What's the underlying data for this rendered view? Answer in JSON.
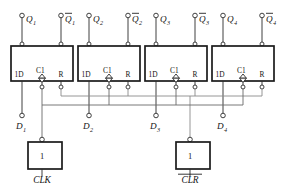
{
  "diagram": {
    "flipflops": [
      {
        "id": "ff1",
        "pins": {
          "d": "1D",
          "clk": "C1",
          "r": "R"
        },
        "outputs": {
          "q": "Q",
          "q_sub": "1",
          "qbar": "Q",
          "qbar_sub": "1"
        },
        "input": {
          "label": "D",
          "sub": "1"
        }
      },
      {
        "id": "ff2",
        "pins": {
          "d": "1D",
          "clk": "C1",
          "r": "R"
        },
        "outputs": {
          "q": "Q",
          "q_sub": "2",
          "qbar": "Q",
          "qbar_sub": "2"
        },
        "input": {
          "label": "D",
          "sub": "2"
        }
      },
      {
        "id": "ff3",
        "pins": {
          "d": "1D",
          "clk": "C1",
          "r": "R"
        },
        "outputs": {
          "q": "Q",
          "q_sub": "3",
          "qbar": "Q",
          "qbar_sub": "3"
        },
        "input": {
          "label": "D",
          "sub": "3"
        }
      },
      {
        "id": "ff4",
        "pins": {
          "d": "1D",
          "clk": "C1",
          "r": "R"
        },
        "outputs": {
          "q": "Q",
          "q_sub": "4",
          "qbar": "Q",
          "qbar_sub": "4"
        },
        "input": {
          "label": "D",
          "sub": "4"
        }
      }
    ],
    "gates": [
      {
        "id": "clk-buffer",
        "symbol": "1",
        "name": "CLK",
        "overline": false
      },
      {
        "id": "clr-buffer",
        "symbol": "1",
        "name": "CLR",
        "overline": true
      }
    ],
    "colors": {
      "wire": "#2b2b2b",
      "bus_clock": "#8a8a8a",
      "bus_reset": "#6a6a6a",
      "box_stroke": "#1a1a1a",
      "background": "#ffffff"
    }
  }
}
